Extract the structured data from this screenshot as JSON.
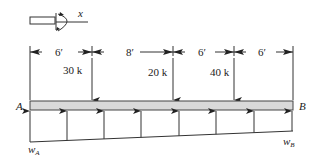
{
  "diagram": {
    "type": "beam-loading",
    "sign_convention": {
      "axis_label": "x"
    },
    "dimensions": [
      {
        "label": "6′",
        "from_x": 30,
        "to_x": 92
      },
      {
        "label": "8′",
        "from_x": 92,
        "to_x": 173
      },
      {
        "label": "6′",
        "from_x": 173,
        "to_x": 234
      },
      {
        "label": "6′",
        "from_x": 234,
        "to_x": 293
      }
    ],
    "point_loads": [
      {
        "label": "30 k",
        "x": 92
      },
      {
        "label": "20 k",
        "x": 173
      },
      {
        "label": "40 k",
        "x": 234
      }
    ],
    "beam": {
      "left_label": "A",
      "right_label": "B"
    },
    "distributed_load": {
      "left_label": "w",
      "left_sub": "A",
      "right_label": "w",
      "right_sub": "B"
    },
    "colors": {
      "beam_fill": "#d9d9d9",
      "stroke": "#333333"
    }
  }
}
